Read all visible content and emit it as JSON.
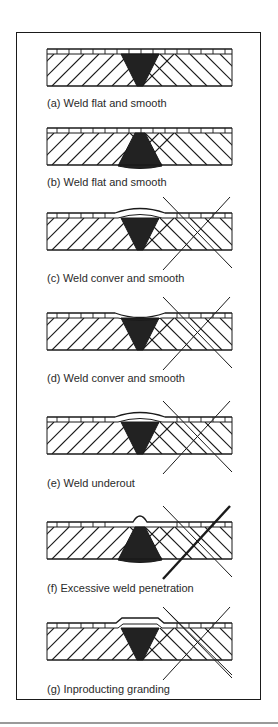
{
  "figure": {
    "panels": [
      {
        "id": "a",
        "caption": "(a) Weld flat and smooth",
        "weld": "v-flat",
        "crossed": false,
        "cross_style": "none"
      },
      {
        "id": "b",
        "caption": "(b) Weld flat and smooth",
        "weld": "fan-flat",
        "crossed": false,
        "cross_style": "none"
      },
      {
        "id": "c",
        "caption": "(c) Weld conver and smooth",
        "weld": "v-convex",
        "crossed": true,
        "cross_style": "thin"
      },
      {
        "id": "d",
        "caption": "(d) Weld conver and smooth",
        "weld": "v-concave",
        "crossed": true,
        "cross_style": "thin"
      },
      {
        "id": "e",
        "caption": "(e) Weld underout",
        "weld": "v-undercut",
        "crossed": true,
        "cross_style": "thin"
      },
      {
        "id": "f",
        "caption": "(f) Excessive weld penetration",
        "weld": "fan-bump",
        "crossed": true,
        "cross_style": "thick-forward"
      },
      {
        "id": "g",
        "caption": "(g) Inproducting granding",
        "weld": "v-plateau",
        "crossed": true,
        "cross_style": "double-back"
      }
    ]
  },
  "colors": {
    "ink": "#1a1a1a",
    "weld_fill": "#222222",
    "caption": "#2a2a2a",
    "rule": "#9a9a9a"
  }
}
